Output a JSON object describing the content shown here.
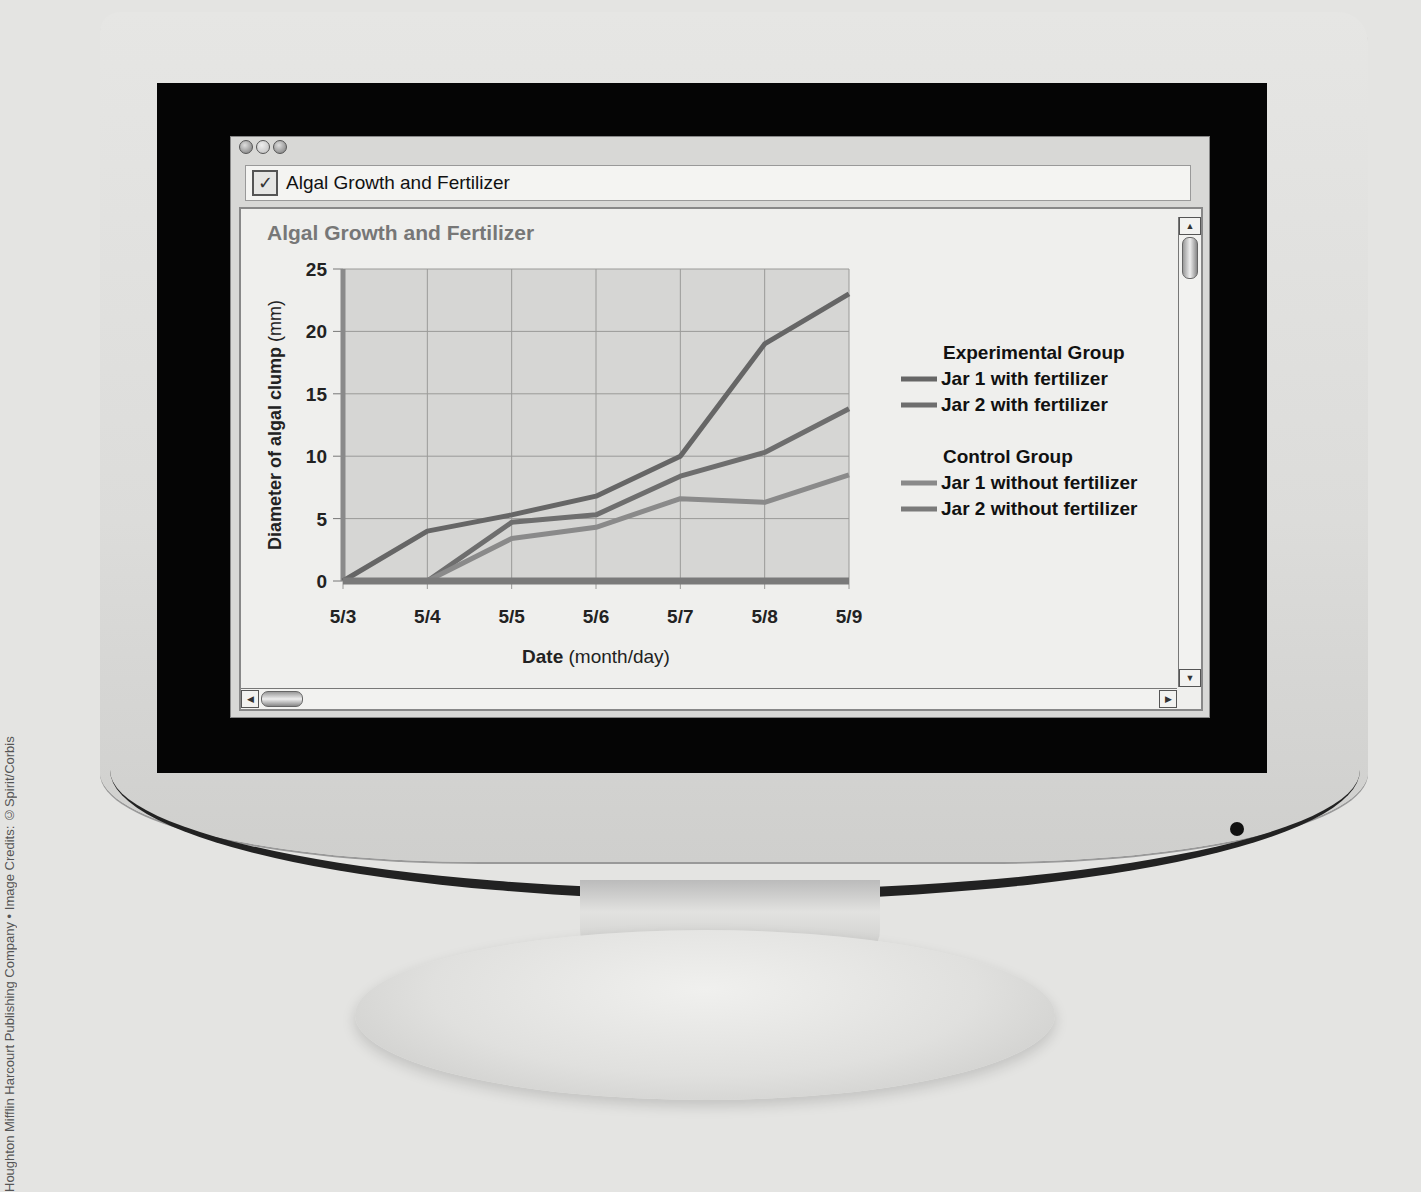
{
  "credit": "Houghton Mifflin Harcourt Publishing Company • Image Credits: ©Spirit/Corbis",
  "window": {
    "title": "Algal Growth and Fertilizer",
    "checkbox_glyph": "✓",
    "scroll": {
      "up": "▲",
      "down": "▼",
      "left": "◀",
      "right": "▶"
    }
  },
  "chart_data": {
    "type": "line",
    "title": "Algal Growth and Fertilizer",
    "xlabel_bold": "Date",
    "xlabel_rest": " (month/day)",
    "ylabel_bold": "Diameter of algal clump",
    "ylabel_rest": " (mm)",
    "categories": [
      "5/3",
      "5/4",
      "5/5",
      "5/6",
      "5/7",
      "5/8",
      "5/9"
    ],
    "ylim": [
      0,
      25
    ],
    "yticks": [
      0,
      5,
      10,
      15,
      20,
      25
    ],
    "grid": true,
    "legend_position": "right",
    "legend_groups": [
      {
        "title": "Experimental Group",
        "entries": [
          "Jar 1 with fertilizer",
          "Jar 2 with fertilizer"
        ]
      },
      {
        "title": "Control Group",
        "entries": [
          "Jar 1 without fertilizer",
          "Jar 2 without fertilizer"
        ]
      }
    ],
    "series": [
      {
        "name": "Jar 1 with fertilizer",
        "color": "#666666",
        "values": [
          0,
          4,
          5.3,
          6.8,
          10,
          19,
          23
        ]
      },
      {
        "name": "Jar 2 with fertilizer",
        "color": "#6e6e6e",
        "values": [
          null,
          0,
          4.7,
          5.3,
          8.4,
          10.3,
          13.8
        ]
      },
      {
        "name": "Jar 1 without fertilizer",
        "color": "#8a8a8a",
        "values": [
          null,
          0,
          3.4,
          4.3,
          6.6,
          6.3,
          8.5
        ]
      },
      {
        "name": "Jar 2 without fertilizer",
        "color": "#7a7a7a",
        "values": [
          0,
          0,
          0,
          0,
          0,
          0,
          0
        ]
      }
    ]
  }
}
